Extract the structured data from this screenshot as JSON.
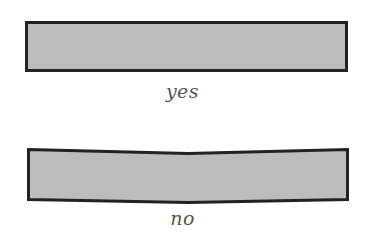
{
  "diagram": {
    "panels": [
      {
        "id": "flat",
        "shape": "rectangle",
        "state": "straight",
        "label": "yes"
      },
      {
        "id": "bowed",
        "shape": "rectangle",
        "state": "bent (sags in middle)",
        "label": "no"
      }
    ],
    "colors": {
      "fill": "#bcbcbc",
      "stroke": "#222222",
      "label": "#555555",
      "background": "#ffffff"
    }
  }
}
